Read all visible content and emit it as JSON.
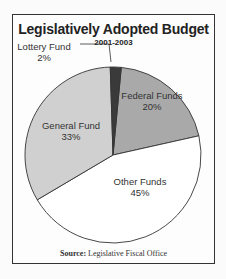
{
  "chart_data": {
    "type": "pie",
    "title": "Legislatively Adopted Budget",
    "subtitle": "2001-2003",
    "slices": [
      {
        "label": "Federal Funds",
        "value": 20,
        "display": "20%",
        "color": "#a9a9a9"
      },
      {
        "label": "Other Funds",
        "value": 45,
        "display": "45%",
        "color": "#ffffff"
      },
      {
        "label": "General Fund",
        "value": 33,
        "display": "33%",
        "color": "#d0d0d0"
      },
      {
        "label": "Lottery Fund",
        "value": 2,
        "display": "2%",
        "color": "#3a3a3a"
      }
    ],
    "start_angle": "top",
    "direction": "clockwise",
    "legend": "none (direct labels)",
    "source_label": "Source:",
    "source_text": "Legislative Fiscal Office"
  }
}
